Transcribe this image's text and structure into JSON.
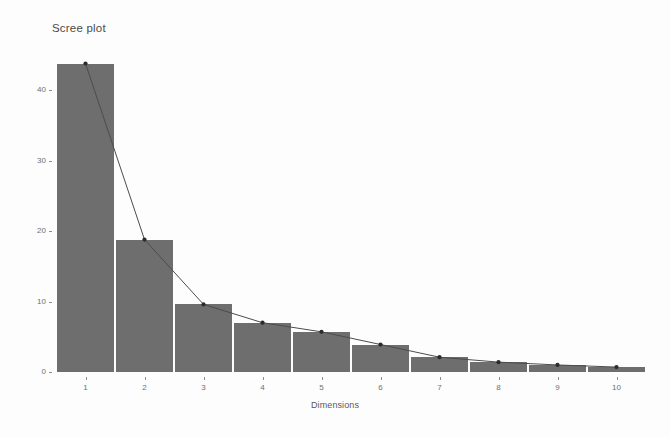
{
  "figure": {
    "title": "Scree plot",
    "background_color": "#fdfdfd",
    "bar_color": "#6e6e6e",
    "line_color": "#4c4c4c",
    "point_color": "#2b2b2b",
    "axis_text_color": "#6f6f6f"
  },
  "axes": {
    "x_title": "Dimensions",
    "y_title": "Percentage of explained variances"
  },
  "chart_data": {
    "type": "bar",
    "title": "Scree plot",
    "subtitle": "",
    "xlabel": "Dimensions",
    "ylabel": "Percentage of explained variances",
    "categories": [
      "1",
      "2",
      "3",
      "4",
      "5",
      "6",
      "7",
      "8",
      "9",
      "10"
    ],
    "values": [
      43.8,
      18.8,
      9.6,
      7.0,
      5.7,
      3.9,
      2.1,
      1.4,
      1.0,
      0.7
    ],
    "series": [
      {
        "name": "Percentage of explained variances",
        "type": "bar",
        "values": [
          43.8,
          18.8,
          9.6,
          7.0,
          5.7,
          3.9,
          2.1,
          1.4,
          1.0,
          0.7
        ]
      },
      {
        "name": "Scree line",
        "type": "line",
        "values": [
          43.8,
          18.8,
          9.6,
          7.0,
          5.7,
          3.9,
          2.1,
          1.4,
          1.0,
          0.7
        ]
      }
    ],
    "xlim": [
      0.5,
      10.5
    ],
    "ylim": [
      0,
      46
    ],
    "ytick_labels": [
      "0",
      "10",
      "20",
      "30",
      "40"
    ],
    "ytick_values": [
      0,
      10,
      20,
      30,
      40
    ],
    "xtick_labels": [
      "1",
      "2",
      "3",
      "4",
      "5",
      "6",
      "7",
      "8",
      "9",
      "10"
    ],
    "grid": false,
    "legend": "none",
    "markers": true
  }
}
